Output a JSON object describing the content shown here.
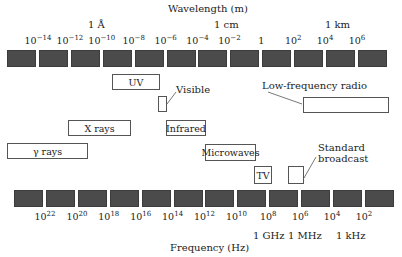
{
  "wavelength_axis": {
    "title": "Wavelength (m)",
    "landmarks": [
      {
        "label": "1 Å",
        "x": 88
      },
      {
        "label": "1 cm",
        "x": 214
      },
      {
        "label": "1 km",
        "x": 325
      }
    ],
    "ticks": [
      {
        "base": "10",
        "exp": "−14"
      },
      {
        "base": "10",
        "exp": "−12"
      },
      {
        "base": "10",
        "exp": "−10"
      },
      {
        "base": "10",
        "exp": "−8"
      },
      {
        "base": "10",
        "exp": "−6"
      },
      {
        "base": "10",
        "exp": "−4"
      },
      {
        "base": "10",
        "exp": "−2"
      },
      {
        "base": "1",
        "exp": ""
      },
      {
        "base": "10",
        "exp": "2"
      },
      {
        "base": "10",
        "exp": "4"
      },
      {
        "base": "10",
        "exp": "6"
      }
    ]
  },
  "frequency_axis": {
    "title": "Frequency (Hz)",
    "landmarks": [
      {
        "label": "1 GHz",
        "x": 253
      },
      {
        "label": "1 MHz",
        "x": 288
      },
      {
        "label": "1 kHz",
        "x": 336
      }
    ],
    "ticks": [
      {
        "base": "10",
        "exp": "22"
      },
      {
        "base": "10",
        "exp": "20"
      },
      {
        "base": "10",
        "exp": "18"
      },
      {
        "base": "10",
        "exp": "16"
      },
      {
        "base": "10",
        "exp": "14"
      },
      {
        "base": "10",
        "exp": "12"
      },
      {
        "base": "10",
        "exp": "10"
      },
      {
        "base": "10",
        "exp": "8"
      },
      {
        "base": "10",
        "exp": "6"
      },
      {
        "base": "10",
        "exp": "4"
      },
      {
        "base": "10",
        "exp": "2"
      }
    ]
  },
  "bands": {
    "uv": "UV",
    "visible": "Visible",
    "xrays": "X rays",
    "infrared": "Infrared",
    "gamma": "γ rays",
    "microwaves": "Microwaves",
    "tv": "TV",
    "standard_broadcast_line1": "Standard",
    "standard_broadcast_line2": "broadcast",
    "low_freq_radio": "Low-frequency radio"
  },
  "colors": {
    "block": "#4b4b4b",
    "box_border": "#555555"
  }
}
